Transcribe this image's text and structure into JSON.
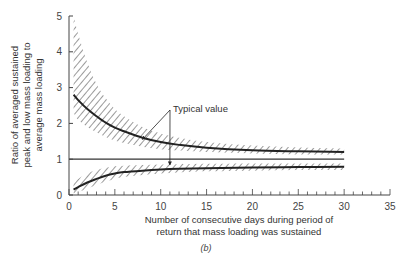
{
  "chart_data": {
    "type": "line",
    "title": "",
    "caption": "(b)",
    "xlabel": [
      "Number of consecutive days during period of",
      "return that mass loading was sustained"
    ],
    "ylabel": [
      "Ratio of averaged sustained",
      "peak and low mass loading to",
      "average mass loading"
    ],
    "xlim": [
      0,
      35
    ],
    "ylim": [
      0,
      5
    ],
    "xticks": [
      0,
      5,
      10,
      15,
      20,
      25,
      30,
      35
    ],
    "yticks": [
      0,
      1,
      2,
      3,
      4,
      5
    ],
    "x_minor_step": 1,
    "grid": false,
    "legend": null,
    "reference_line": {
      "y": 1,
      "x_range": [
        0,
        30
      ]
    },
    "annotations": [
      {
        "text": "Typical value",
        "points_to": [
          {
            "x": 8,
            "y": 1.55
          },
          {
            "x": 11,
            "y": 0.78
          }
        ]
      }
    ],
    "x": [
      0.5,
      1,
      2,
      3,
      4,
      5,
      6,
      8,
      10,
      12,
      15,
      20,
      25,
      30
    ],
    "series": [
      {
        "name": "Peak typical value",
        "style": "solid-bold",
        "values": [
          2.8,
          2.65,
          2.4,
          2.2,
          2.02,
          1.88,
          1.78,
          1.6,
          1.48,
          1.4,
          1.32,
          1.25,
          1.22,
          1.2
        ]
      },
      {
        "name": "Low typical value",
        "style": "solid-bold",
        "values": [
          0.15,
          0.22,
          0.35,
          0.45,
          0.54,
          0.6,
          0.64,
          0.68,
          0.71,
          0.73,
          0.75,
          0.77,
          0.78,
          0.79
        ]
      },
      {
        "name": "Peak band upper",
        "style": "hatched-boundary",
        "values": [
          5.0,
          4.5,
          3.7,
          3.1,
          2.7,
          2.4,
          2.2,
          1.9,
          1.72,
          1.6,
          1.48,
          1.38,
          1.33,
          1.3
        ]
      },
      {
        "name": "Peak band lower",
        "style": "hatched-boundary",
        "values": [
          2.3,
          2.1,
          1.9,
          1.75,
          1.62,
          1.52,
          1.45,
          1.35,
          1.28,
          1.24,
          1.2,
          1.16,
          1.13,
          1.12
        ]
      },
      {
        "name": "Low band upper",
        "style": "hatched-boundary",
        "values": [
          0.35,
          0.45,
          0.6,
          0.7,
          0.76,
          0.8,
          0.82,
          0.84,
          0.85,
          0.86,
          0.87,
          0.88,
          0.88,
          0.88
        ]
      },
      {
        "name": "Low band lower",
        "style": "hatched-boundary",
        "values": [
          0.05,
          0.08,
          0.18,
          0.28,
          0.38,
          0.45,
          0.5,
          0.56,
          0.6,
          0.63,
          0.66,
          0.68,
          0.7,
          0.7
        ]
      }
    ]
  },
  "colors": {
    "line": "#222222",
    "hatch": "#555555",
    "axis": "#444444"
  }
}
